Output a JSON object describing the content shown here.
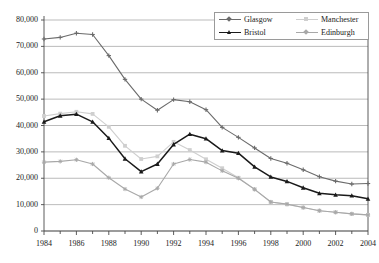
{
  "chart_data": {
    "type": "line",
    "title": "",
    "subtitle": "",
    "xlabel": "",
    "ylabel": "",
    "x": [
      1984,
      1985,
      1986,
      1987,
      1988,
      1989,
      1990,
      1991,
      1992,
      1993,
      1994,
      1995,
      1996,
      1997,
      1998,
      1999,
      2000,
      2001,
      2002,
      2003,
      2004
    ],
    "xlim": [
      1984,
      2004
    ],
    "ylim": [
      0,
      80000
    ],
    "ytick_values": [
      0,
      10000,
      20000,
      30000,
      40000,
      50000,
      60000,
      70000,
      80000
    ],
    "ytick_labels": [
      "0",
      "10,000",
      "20,000",
      "30,000",
      "40,000",
      "50,000",
      "60,000",
      "70,000",
      "80,000"
    ],
    "xtick_values": [
      1984,
      1986,
      1988,
      1990,
      1992,
      1994,
      1996,
      1998,
      2000,
      2002,
      2004
    ],
    "xtick_labels": [
      "1984",
      "1986",
      "1988",
      "1990",
      "1992",
      "1994",
      "1996",
      "1998",
      "2000",
      "2002",
      "2004"
    ],
    "xtick_minor_values": [
      1985,
      1987,
      1989,
      1991,
      1993,
      1995,
      1997,
      1999,
      2001,
      2003
    ],
    "grid": "horizontal",
    "legend_position": "top-right",
    "series": [
      {
        "name": "Glasgow",
        "color": "#6b6b6b",
        "marker": "plus",
        "values": [
          72800,
          73400,
          75000,
          74500,
          66500,
          57500,
          50000,
          45800,
          49800,
          49000,
          46000,
          39300,
          35500,
          31500,
          27500,
          25700,
          23200,
          20600,
          18900,
          17800,
          18000
        ]
      },
      {
        "name": "Manchester",
        "color": "#cfcfcf",
        "marker": "square",
        "values": [
          43600,
          44500,
          45200,
          44400,
          39500,
          32300,
          27300,
          28300,
          33800,
          30700,
          27200,
          23800,
          20200,
          15800,
          11000,
          10100,
          8900,
          7700,
          7100,
          6500,
          6100
        ]
      },
      {
        "name": "Bristol",
        "color": "#1a1a1a",
        "marker": "triangle",
        "values": [
          41400,
          43700,
          44300,
          41400,
          35200,
          27400,
          22500,
          25400,
          32800,
          36700,
          35000,
          30500,
          29500,
          24300,
          20500,
          18800,
          16400,
          14300,
          13700,
          13400,
          12200
        ]
      },
      {
        "name": "Edinburgh",
        "color": "#a8a8a8",
        "marker": "star",
        "values": [
          26100,
          26400,
          27000,
          25400,
          20200,
          15900,
          12900,
          16200,
          25400,
          27100,
          26100,
          22800,
          20000,
          15800,
          11000,
          10200,
          8900,
          7700,
          7100,
          6500,
          6100
        ]
      }
    ]
  },
  "legend": {
    "entries": [
      {
        "label": "Glasgow"
      },
      {
        "label": "Manchester"
      },
      {
        "label": "Bristol"
      },
      {
        "label": "Edinburgh"
      }
    ]
  }
}
